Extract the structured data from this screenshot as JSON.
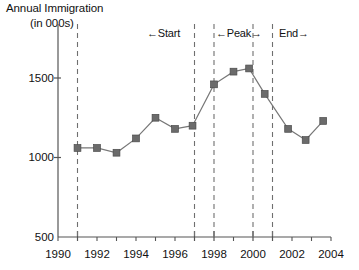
{
  "chart_data": {
    "type": "line",
    "title": "Annual Immigration (in 000s)",
    "title_lines": [
      "Annual Immigration",
      "(in 000s)"
    ],
    "xlabel": "",
    "ylabel": "Annual Immigration (in 000s)",
    "xlim": [
      1990,
      2004
    ],
    "ylim": [
      500,
      1600
    ],
    "y_ticks": [
      500,
      1000,
      1500
    ],
    "y_tick_labels": [
      "500",
      "1000",
      "1500"
    ],
    "x_ticks": [
      1990,
      1991,
      1992,
      1993,
      1994,
      1995,
      1996,
      1997,
      1998,
      1999,
      2000,
      2001,
      2002,
      2003,
      2004
    ],
    "x_tick_labels_shown": [
      "1990",
      "1992",
      "1994",
      "1996",
      "1998",
      "2000",
      "2002",
      "2004"
    ],
    "x_labeled_ticks": [
      1990,
      1992,
      1994,
      1996,
      1998,
      2000,
      2002,
      2004
    ],
    "grid": false,
    "legend": "none",
    "marker": "square",
    "series_color": "#6b6b6b",
    "line_color": "#777777",
    "axis_color": "#555555",
    "series": [
      {
        "name": "Annual Immigration",
        "x": [
          1991.0,
          1992.0,
          1993.0,
          1994.0,
          1995.0,
          1996.0,
          1996.9,
          1998.0,
          1999.0,
          1999.8,
          2000.6,
          2001.8,
          2002.7,
          2003.6
        ],
        "values": [
          1060,
          1060,
          1030,
          1120,
          1250,
          1180,
          1200,
          1460,
          1540,
          1560,
          1400,
          1180,
          1110,
          1230
        ]
      }
    ],
    "annotations": [
      {
        "label": "←Start",
        "name": "start-band-label",
        "x_from": 1991.0,
        "x_to": 1997.0
      },
      {
        "label": "←Peak→",
        "name": "peak-band-label",
        "x_from": 1998.0,
        "x_to": 2000.0
      },
      {
        "label": "End→",
        "name": "end-band-label",
        "x_from": 2001.0,
        "x_to": 2004.0
      }
    ],
    "reference_lines": [
      {
        "name": "dashed-line-1991",
        "x": 1991.0
      },
      {
        "name": "dashed-line-1997",
        "x": 1997.0
      },
      {
        "name": "dashed-line-1998",
        "x": 1998.0
      },
      {
        "name": "dashed-line-2000",
        "x": 2000.0
      },
      {
        "name": "dashed-line-2001",
        "x": 2001.0
      }
    ]
  },
  "labels": {
    "title_1": "Annual Immigration",
    "title_2": "(in 000s)",
    "y_500": "500",
    "y_1000": "1000",
    "y_1500": "1500",
    "x_1990": "1990",
    "x_1992": "1992",
    "x_1994": "1994",
    "x_1996": "1996",
    "x_1998": "1998",
    "x_2000": "2000",
    "x_2002": "2002",
    "x_2004": "2004",
    "band_start": "←Start",
    "band_peak": "←Peak→",
    "band_end": "End→"
  }
}
